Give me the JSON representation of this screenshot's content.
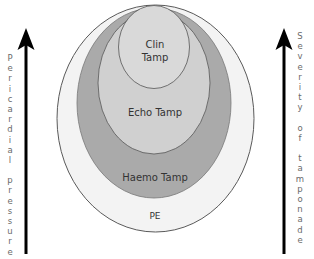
{
  "diagram": {
    "title": "",
    "left_axis": {
      "label": "Pericardial pressure",
      "direction": "up"
    },
    "right_axis": {
      "label": "Severity of tamponade",
      "direction": "up"
    },
    "regions": [
      {
        "id": "pe",
        "label": "PE",
        "fill": "#f2f2f2",
        "stroke": "#555555"
      },
      {
        "id": "haemo",
        "label": "Haemo Tamp",
        "fill": "#a9a9a9",
        "stroke": "#666666"
      },
      {
        "id": "echo",
        "label": "Echo Tamp",
        "fill": "#cfcfcf",
        "stroke": "#555555"
      },
      {
        "id": "clin",
        "label_line1": "Clin",
        "label_line2": "Tamp",
        "fill": "#d9d9d9",
        "stroke": "#555555"
      }
    ],
    "arrow_color": "#000000"
  }
}
